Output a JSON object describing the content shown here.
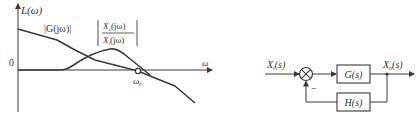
{
  "figure": {
    "bode_plot": {
      "y_axis_label": "L(ω)",
      "x_axis_label": "ω",
      "origin_label": "0",
      "crossover_label": "ω",
      "crossover_subscript": "c",
      "curves": [
        {
          "name": "open-loop",
          "label_prefix": "|G(",
          "label_j": "jω",
          "label_suffix": ")|"
        },
        {
          "name": "closed-loop",
          "numerator": "X",
          "numerator_sub": "o",
          "numerator_arg": "(jω)",
          "denominator": "X",
          "denominator_sub": "i",
          "denominator_arg": "(jω)"
        }
      ],
      "line_color": "#3a3a3a"
    },
    "block_diagram": {
      "input_label": "X",
      "input_sub": "i",
      "input_arg": "(s)",
      "output_label": "X",
      "output_sub": "o",
      "output_arg": "(s)",
      "forward_block": "G(s)",
      "feedback_block": "H(s)",
      "feedback_sign": "−",
      "summing_junction": "⊗"
    }
  }
}
